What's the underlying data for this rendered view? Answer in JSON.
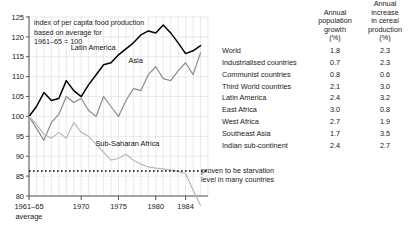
{
  "chart_data": {
    "type": "line",
    "caption_lines": [
      "index of per capita food production",
      "based on average for",
      "1961–65  =  100"
    ],
    "xlabel": "",
    "xlabel_sub": "average",
    "ylabel": "",
    "ylim": [
      77,
      125
    ],
    "xlim": [
      1963,
      1987
    ],
    "grid": true,
    "legend_position": "inline-labels",
    "yticks": [
      80,
      85,
      90,
      95,
      100,
      105,
      110,
      115,
      120,
      125
    ],
    "ytick_labels": [
      "80",
      "85",
      "90",
      "95",
      "100",
      "105",
      "110",
      "115",
      "120",
      "125"
    ],
    "xticks": [
      1963,
      1970,
      1975,
      1980,
      1984
    ],
    "xtick_labels": [
      "1961–65",
      "1970",
      "1975",
      "1980",
      "1984"
    ],
    "x": [
      1963,
      1964,
      1965,
      1966,
      1967,
      1968,
      1969,
      1970,
      1971,
      1972,
      1973,
      1974,
      1975,
      1976,
      1977,
      1978,
      1979,
      1980,
      1981,
      1982,
      1983,
      1984,
      1985,
      1986
    ],
    "series": [
      {
        "name": "Latin America",
        "color": "#000000",
        "label_x": 1971.6,
        "label_y": 116.8,
        "values": [
          100,
          102.5,
          106,
          104,
          104.5,
          109,
          106.5,
          105,
          108,
          110.5,
          113,
          113.5,
          115.5,
          117,
          118.5,
          120.5,
          121.5,
          121,
          123,
          121,
          118.5,
          115.8,
          116.5,
          117.8
        ]
      },
      {
        "name": "Asia",
        "color": "#8c8c8c",
        "label_x": 1977.3,
        "label_y": 113.5,
        "values": [
          100,
          97,
          94,
          98.5,
          100.5,
          105,
          103.5,
          104.5,
          101.5,
          100,
          105,
          102.5,
          100,
          104,
          107,
          106.5,
          110.5,
          112.5,
          109.5,
          109,
          111.5,
          113.5,
          110.5,
          116
        ]
      },
      {
        "name": "Sub-Saharan Africa",
        "color": "#b8b8b8",
        "label_x": 1976.2,
        "label_y": 92.5,
        "values": [
          100,
          98,
          95.5,
          94.5,
          96,
          94.5,
          98.5,
          96,
          95,
          93,
          91,
          89,
          89.5,
          90.5,
          89,
          88,
          87.3,
          87,
          86.8,
          86.5,
          86.2,
          85.6,
          81.5,
          77.6
        ]
      }
    ],
    "threshold_line": {
      "value": 86.3,
      "style": "dotted",
      "color": "#000000",
      "note": "proven to be starvation level in many countries",
      "note_lines": [
        "proven to be starvation",
        "level in many countries"
      ]
    }
  },
  "table": {
    "headers": {
      "region": "",
      "col1_lines": [
        "Annual",
        "population",
        "growth"
      ],
      "col1_unit": "(%)",
      "col2_lines": [
        "Annual",
        "increase",
        "in cereal",
        "production"
      ],
      "col2_unit": "(%)"
    },
    "rows": [
      {
        "region": "World",
        "population_growth": "1.8",
        "cereal_increase": "2.3"
      },
      {
        "region": "Industrialised countries",
        "population_growth": "0.7",
        "cereal_increase": "2.3"
      },
      {
        "region": "Communist countries",
        "population_growth": "0.8",
        "cereal_increase": "0.6"
      },
      {
        "region": "Third World countries",
        "population_growth": "2.1",
        "cereal_increase": "3.0"
      },
      {
        "region": "Latin America",
        "population_growth": "2.4",
        "cereal_increase": "3.2"
      },
      {
        "region": "East Africa",
        "population_growth": "3.0",
        "cereal_increase": "0.8"
      },
      {
        "region": "West Africa",
        "population_growth": "2.7",
        "cereal_increase": "1.9"
      },
      {
        "region": "Southeast Asia",
        "population_growth": "1.7",
        "cereal_increase": "3.5"
      },
      {
        "region": "Indian sub-continent",
        "population_growth": "2.4",
        "cereal_increase": "2.7"
      }
    ]
  },
  "colors": {
    "axis": "#555555",
    "grid": "#dcdcdc",
    "text": "#1a1a1a"
  }
}
